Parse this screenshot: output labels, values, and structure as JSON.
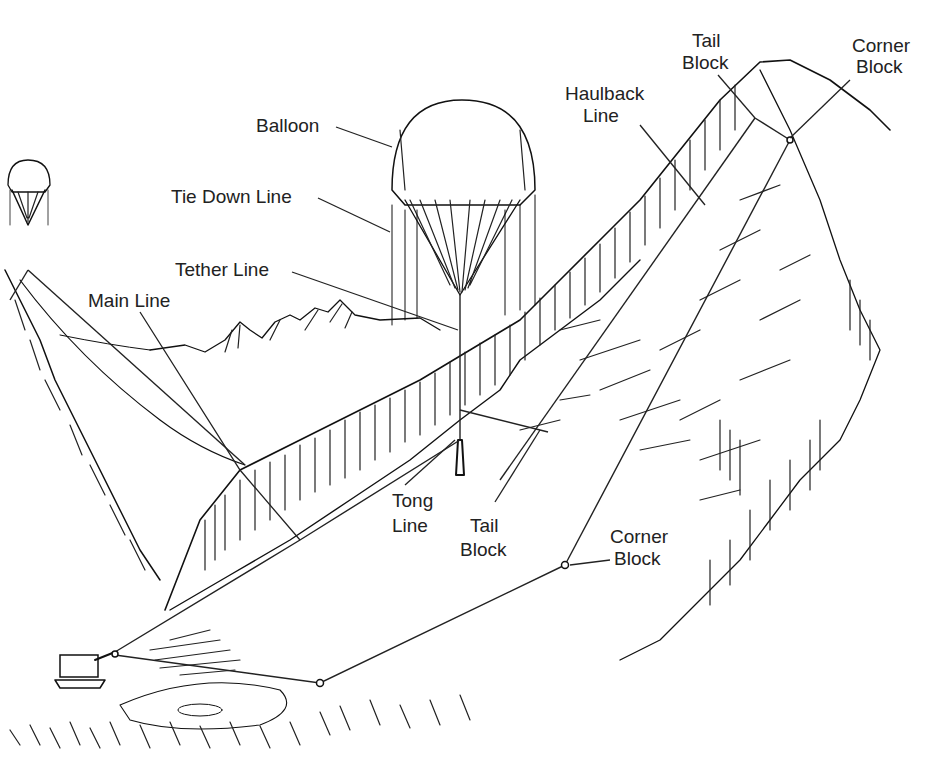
{
  "diagram": {
    "colors": {
      "ink": "#111111",
      "background": "#ffffff"
    },
    "labels": {
      "balloon": "Balloon",
      "tie_down_line": "Tie Down Line",
      "tether_line": "Tether Line",
      "main_line": "Main Line",
      "tong_line_1": "Tong",
      "tong_line_2": "Line",
      "tail_block_low_1": "Tail",
      "tail_block_low_2": "Block",
      "corner_block_low_1": "Corner",
      "corner_block_low_2": "Block",
      "haulback_line_1": "Haulback",
      "haulback_line_2": "Line",
      "tail_block_top_1": "Tail",
      "tail_block_top_2": "Block",
      "corner_block_top_1": "Corner",
      "corner_block_top_2": "Block"
    }
  }
}
